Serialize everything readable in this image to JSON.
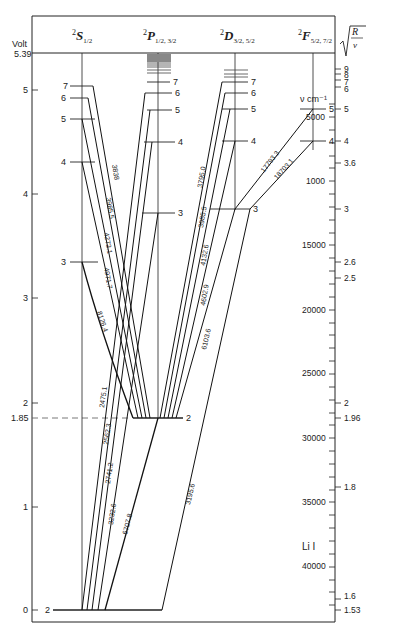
{
  "title": "Li I",
  "axes": {
    "left_label": "Volt",
    "ionization_label": "5.39",
    "left_ticks": [
      {
        "label": "5",
        "value": 5
      },
      {
        "label": "4",
        "value": 4
      },
      {
        "label": "3",
        "value": 3
      },
      {
        "label": "2",
        "value": 2
      },
      {
        "label": "1.85",
        "value": 1.85
      },
      {
        "label": "1",
        "value": 1
      },
      {
        "label": "0",
        "value": 0
      }
    ],
    "wavenumber_label": "ν  cm⁻¹",
    "wavenumber_ticks": [
      "5000",
      "1000",
      "15000",
      "20000",
      "25000",
      "30000",
      "35000",
      "40000"
    ],
    "right_label": "√(R/ν)",
    "right_ticks": [
      "9",
      "8",
      "7",
      "6",
      "5",
      "4",
      "3.6",
      "3",
      "2.6",
      "2.5",
      "2",
      "1.96",
      "1.8",
      "1.6",
      "1.53"
    ]
  },
  "columns": [
    {
      "term": "2S",
      "sub": "1/2",
      "label_html": "²S½"
    },
    {
      "term": "2P",
      "sub": "1/2, 3/2",
      "label_html": "²P½, 3/2"
    },
    {
      "term": "2D",
      "sub": "3/2, 5/2",
      "label_html": "²D3/2, 5/2"
    },
    {
      "term": "2F",
      "sub": "5/2, 7/2",
      "label_html": "²F5/2, 7/2"
    }
  ],
  "levels": {
    "S": [
      {
        "n": "2",
        "V": 0
      },
      {
        "n": "3",
        "V": 3.37
      },
      {
        "n": "4",
        "V": 4.34
      },
      {
        "n": "5",
        "V": 4.75
      },
      {
        "n": "6",
        "V": 4.96
      },
      {
        "n": "7",
        "V": 5.06
      }
    ],
    "P": [
      {
        "n": "2",
        "V": 1.85
      },
      {
        "n": "3",
        "V": 3.83
      },
      {
        "n": "4",
        "V": 4.52
      },
      {
        "n": "5",
        "V": 4.84
      },
      {
        "n": "6",
        "V": 5.01
      },
      {
        "n": "7",
        "V": 5.11
      }
    ],
    "D": [
      {
        "n": "3",
        "V": 3.88
      },
      {
        "n": "4",
        "V": 4.54
      },
      {
        "n": "5",
        "V": 4.85
      },
      {
        "n": "6",
        "V": 5.02
      },
      {
        "n": "7",
        "V": 5.12
      }
    ],
    "F": [
      {
        "n": "4",
        "V": 4.54
      },
      {
        "n": "5",
        "V": 4.85
      }
    ]
  },
  "transitions": [
    {
      "label": "3838",
      "from": "S7",
      "to": "P2"
    },
    {
      "label": "3985.5",
      "from": "S6",
      "to": "P2"
    },
    {
      "label": "4273.1",
      "from": "S5",
      "to": "P2"
    },
    {
      "label": "4971.7",
      "from": "S4",
      "to": "P2"
    },
    {
      "label": "8126.4",
      "from": "S3",
      "to": "P2"
    },
    {
      "label": "2475.1",
      "from": "S2",
      "to": "P6"
    },
    {
      "label": "2562.3",
      "from": "S2",
      "to": "P5"
    },
    {
      "label": "2741.2",
      "from": "S2",
      "to": "P4"
    },
    {
      "label": "3232.6",
      "from": "S2",
      "to": "P3"
    },
    {
      "label": "6707.8",
      "from": "S2",
      "to": "P2"
    },
    {
      "label": "3795.0",
      "from": "D7",
      "to": "P2"
    },
    {
      "label": "3985.5",
      "from": "D6",
      "to": "P2"
    },
    {
      "label": "4132.6",
      "from": "D5",
      "to": "P2"
    },
    {
      "label": "4602.9",
      "from": "D4",
      "to": "P2"
    },
    {
      "label": "6103.6",
      "from": "D3",
      "to": "P2"
    },
    {
      "label": "3195.6",
      "from": "P3",
      "to": "S2"
    },
    {
      "label": "17793.3",
      "from": "F5",
      "to": "D3"
    },
    {
      "label": "18703.1",
      "from": "F4",
      "to": "D3"
    }
  ]
}
